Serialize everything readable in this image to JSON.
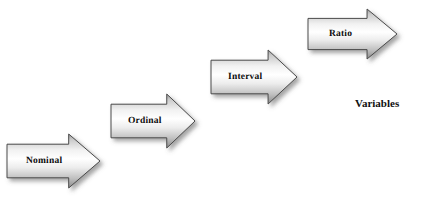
{
  "diagram": {
    "background_color": "#ffffff",
    "arrows": [
      {
        "id": "nominal",
        "label": "Nominal",
        "x": 6,
        "y": 133,
        "width": 95,
        "height": 56,
        "shaft_top_ratio": 0.2,
        "shaft_bottom_ratio": 0.8,
        "head_start_ratio": 0.66,
        "font_size": 9.5,
        "label_offset_x": 20,
        "fill_light": "#ffffff",
        "fill_mid": "#e3e3e3",
        "fill_dark": "#8e8e8e",
        "stroke": "#4a4a4a"
      },
      {
        "id": "ordinal",
        "label": "Ordinal",
        "x": 110,
        "y": 93,
        "width": 86,
        "height": 56,
        "shaft_top_ratio": 0.2,
        "shaft_bottom_ratio": 0.8,
        "head_start_ratio": 0.66,
        "font_size": 9.5,
        "label_offset_x": 18,
        "fill_light": "#ffffff",
        "fill_mid": "#e3e3e3",
        "fill_dark": "#8e8e8e",
        "stroke": "#4a4a4a"
      },
      {
        "id": "interval",
        "label": "Interval",
        "x": 210,
        "y": 49,
        "width": 88,
        "height": 56,
        "shaft_top_ratio": 0.2,
        "shaft_bottom_ratio": 0.8,
        "head_start_ratio": 0.66,
        "font_size": 9.5,
        "label_offset_x": 18,
        "fill_light": "#ffffff",
        "fill_mid": "#e3e3e3",
        "fill_dark": "#8e8e8e",
        "stroke": "#4a4a4a"
      },
      {
        "id": "ratio",
        "label": "Ratio",
        "x": 307,
        "y": 8,
        "width": 91,
        "height": 52,
        "shaft_top_ratio": 0.2,
        "shaft_bottom_ratio": 0.8,
        "head_start_ratio": 0.66,
        "font_size": 9.5,
        "label_offset_x": 22,
        "fill_light": "#ffffff",
        "fill_mid": "#e3e3e3",
        "fill_dark": "#8e8e8e",
        "stroke": "#4a4a4a"
      }
    ],
    "caption": {
      "text": "Variables",
      "x": 355,
      "y": 97,
      "font_size": 11,
      "color": "#111111"
    }
  }
}
